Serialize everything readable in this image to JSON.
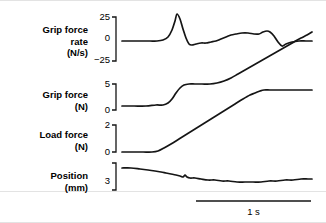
{
  "figure": {
    "width": 326,
    "height": 223,
    "background": "#ffffff",
    "trace_color": "#151515",
    "plot_x_start": 122,
    "plot_x_end": 312
  },
  "panels": [
    {
      "name": "grip-force-rate",
      "label": "Grip force\nrate\n(N/s)",
      "label_top": 24,
      "unit": "N/s",
      "ticks": [
        {
          "value": "25",
          "y": 17
        },
        {
          "value": "0",
          "y": 38
        },
        {
          "value": "−25",
          "y": 60
        }
      ],
      "bracket": {
        "x": 116,
        "y_top": 17,
        "y_bottom": 61,
        "tick_len": 4
      }
    },
    {
      "name": "grip-force",
      "label": "Grip force\n(N)",
      "label_top": 89,
      "unit": "N",
      "ticks": [
        {
          "value": "5",
          "y": 84
        },
        {
          "value": "0",
          "y": 110
        }
      ],
      "bracket": {
        "x": 116,
        "y_top": 84,
        "y_bottom": 110,
        "tick_len": 4
      }
    },
    {
      "name": "load-force",
      "label": "Load force\n(N)",
      "label_top": 129,
      "unit": "N",
      "ticks": [
        {
          "value": "2",
          "y": 125
        },
        {
          "value": "0",
          "y": 152
        }
      ],
      "bracket": {
        "x": 116,
        "y_top": 125,
        "y_bottom": 152,
        "tick_len": 4
      }
    },
    {
      "name": "position",
      "label": "Position\n(mm)",
      "label_top": 170,
      "unit": "mm",
      "ticks": [
        {
          "value": "3",
          "y": 181
        }
      ],
      "bracket": {
        "x": 116,
        "y_top": 163,
        "y_bottom": 190,
        "tick_len": 4
      }
    }
  ],
  "scalebar": {
    "label": "1 s",
    "x_start": 196,
    "x_end": 311,
    "y": 201,
    "label_y": 206
  },
  "chart_data": {
    "type": "line",
    "title": "",
    "xlabel": "",
    "ylabel": "",
    "grid": false,
    "legend": "none",
    "x_scale_note": "horizontal scale bar indicates 1 s spanning x=196 to x=311 px",
    "series": [
      {
        "name": "Grip force rate",
        "unit": "N/s",
        "ylim": [
          -25,
          25
        ],
        "axis_px": {
          "y_max": 17,
          "y_zero": 38,
          "y_min": 60
        },
        "points_px": [
          [
            122,
            41
          ],
          [
            132,
            41
          ],
          [
            142,
            41
          ],
          [
            150,
            41
          ],
          [
            157,
            41
          ],
          [
            163,
            40
          ],
          [
            168,
            37
          ],
          [
            172,
            30
          ],
          [
            175,
            21
          ],
          [
            177,
            14
          ],
          [
            180,
            19
          ],
          [
            183,
            29
          ],
          [
            186,
            38
          ],
          [
            189,
            44
          ],
          [
            192,
            45
          ],
          [
            196,
            44
          ],
          [
            201,
            43
          ],
          [
            206,
            43
          ],
          [
            211,
            42
          ],
          [
            216,
            41
          ],
          [
            221,
            39
          ],
          [
            226,
            37
          ],
          [
            231,
            35
          ],
          [
            236,
            34
          ],
          [
            242,
            33
          ],
          [
            248,
            33
          ],
          [
            254,
            34
          ],
          [
            259,
            34
          ],
          [
            263,
            32
          ],
          [
            267,
            31
          ],
          [
            270,
            32
          ],
          [
            274,
            36
          ],
          [
            278,
            42
          ],
          [
            282,
            46
          ],
          [
            286,
            44
          ],
          [
            292,
            42
          ],
          [
            299,
            41
          ],
          [
            306,
            41
          ],
          [
            312,
            41
          ]
        ]
      },
      {
        "name": "Grip force",
        "unit": "N",
        "ylim": [
          0,
          5
        ],
        "axis_px": {
          "y_max": 84,
          "y_zero": 110
        },
        "points_px": [
          [
            122,
            106
          ],
          [
            134,
            106
          ],
          [
            146,
            106
          ],
          [
            156,
            105
          ],
          [
            163,
            105
          ],
          [
            168,
            103
          ],
          [
            172,
            99
          ],
          [
            176,
            93
          ],
          [
            180,
            88
          ],
          [
            184,
            85
          ],
          [
            189,
            84
          ],
          [
            195,
            84
          ],
          [
            202,
            84
          ],
          [
            210,
            84
          ],
          [
            217,
            83
          ],
          [
            224,
            81
          ],
          [
            231,
            78
          ],
          [
            238,
            74
          ],
          [
            245,
            70
          ],
          [
            252,
            66
          ],
          [
            259,
            62
          ],
          [
            266,
            58
          ],
          [
            273,
            54
          ],
          [
            280,
            50
          ],
          [
            287,
            46
          ],
          [
            294,
            42
          ],
          [
            301,
            38
          ],
          [
            307,
            35
          ],
          [
            312,
            32
          ]
        ]
      },
      {
        "name": "Load force",
        "unit": "N",
        "ylim": [
          0,
          2
        ],
        "axis_px": {
          "y_max": 125,
          "y_zero": 152
        },
        "points_px": [
          [
            122,
            152
          ],
          [
            133,
            152
          ],
          [
            143,
            152
          ],
          [
            152,
            152
          ],
          [
            158,
            151
          ],
          [
            164,
            148
          ],
          [
            171,
            144
          ],
          [
            179,
            139
          ],
          [
            187,
            134
          ],
          [
            195,
            129
          ],
          [
            203,
            124
          ],
          [
            211,
            119
          ],
          [
            219,
            114
          ],
          [
            227,
            109
          ],
          [
            235,
            104
          ],
          [
            243,
            99
          ],
          [
            250,
            95
          ],
          [
            255,
            93
          ],
          [
            260,
            91
          ],
          [
            264,
            90
          ],
          [
            270,
            90
          ],
          [
            278,
            90
          ],
          [
            287,
            90
          ],
          [
            296,
            90
          ],
          [
            304,
            90
          ],
          [
            312,
            90
          ]
        ]
      },
      {
        "name": "Position",
        "unit": "mm",
        "ylim": [
          3,
          3
        ],
        "axis_px": {
          "y_ref": 181
        },
        "points_px": [
          [
            122,
            168
          ],
          [
            131,
            168
          ],
          [
            140,
            169
          ],
          [
            148,
            170
          ],
          [
            155,
            171
          ],
          [
            161,
            172
          ],
          [
            166,
            173
          ],
          [
            171,
            174
          ],
          [
            176,
            175
          ],
          [
            180,
            176
          ],
          [
            183,
            177
          ],
          [
            185,
            175
          ],
          [
            187,
            177
          ],
          [
            190,
            178
          ],
          [
            195,
            178
          ],
          [
            201,
            179
          ],
          [
            208,
            180
          ],
          [
            215,
            180
          ],
          [
            222,
            181
          ],
          [
            229,
            181
          ],
          [
            237,
            182
          ],
          [
            245,
            182
          ],
          [
            253,
            182
          ],
          [
            261,
            182
          ],
          [
            269,
            181
          ],
          [
            277,
            181
          ],
          [
            285,
            180
          ],
          [
            293,
            180
          ],
          [
            301,
            179
          ],
          [
            308,
            179
          ],
          [
            312,
            179
          ]
        ]
      }
    ]
  }
}
